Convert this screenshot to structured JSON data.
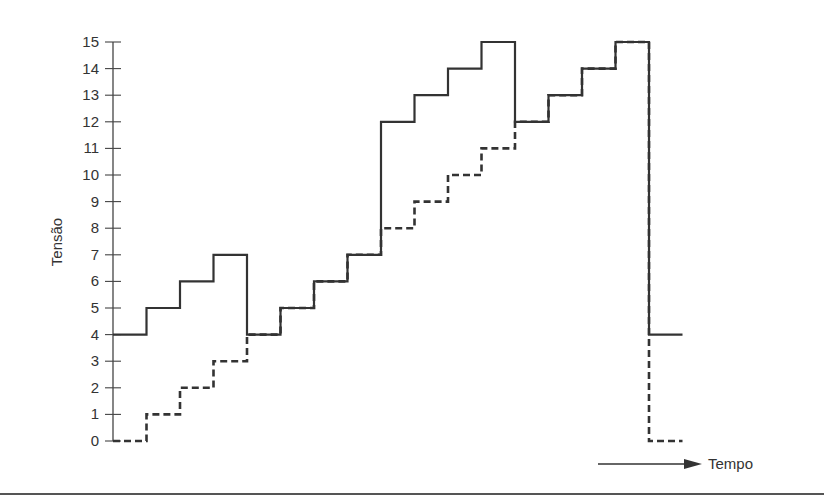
{
  "chart_data": {
    "type": "line",
    "subtype": "step",
    "title": "",
    "xlabel": "Tempo",
    "ylabel": "Tensão",
    "ylim": [
      0,
      15
    ],
    "yticks": [
      0,
      1,
      2,
      3,
      4,
      5,
      6,
      7,
      8,
      9,
      10,
      11,
      12,
      13,
      14,
      15
    ],
    "grid": false,
    "legend": null,
    "x": [
      0,
      1,
      2,
      3,
      4,
      5,
      6,
      7,
      8,
      9,
      10,
      11,
      12,
      13,
      14,
      15,
      16
    ],
    "series": [
      {
        "name": "solid",
        "style": "solid",
        "values": [
          4,
          5,
          6,
          7,
          4,
          5,
          6,
          7,
          12,
          13,
          14,
          15,
          12,
          13,
          14,
          15,
          4
        ]
      },
      {
        "name": "dashed",
        "style": "dashed",
        "values": [
          0,
          1,
          2,
          3,
          4,
          5,
          6,
          7,
          8,
          9,
          10,
          11,
          12,
          13,
          14,
          15,
          0
        ]
      }
    ],
    "annotations": [
      {
        "type": "arrow",
        "label": "Tempo",
        "direction": "right"
      }
    ]
  },
  "labels": {
    "ylabel": "Tensão",
    "xlabel": "Tempo"
  },
  "colors": {
    "line": "#333333",
    "axis": "#444444",
    "rule": "#555555"
  }
}
